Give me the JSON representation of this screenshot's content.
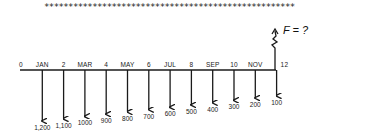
{
  "header": {
    "separator": "****************************************************"
  },
  "cash_flow_diagram": {
    "axis_labels": [
      "0",
      "JAN",
      "2",
      "MAR",
      "4",
      "MAY",
      "6",
      "JUL",
      "8",
      "SEP",
      "10",
      "NOV",
      "12"
    ],
    "payments": [
      {
        "period": 1,
        "label": "1,200"
      },
      {
        "period": 2,
        "label": "1,100"
      },
      {
        "period": 3,
        "label": "1000"
      },
      {
        "period": 4,
        "label": "900"
      },
      {
        "period": 5,
        "label": "800"
      },
      {
        "period": 6,
        "label": "700"
      },
      {
        "period": 7,
        "label": "600"
      },
      {
        "period": 8,
        "label": "500"
      },
      {
        "period": 9,
        "label": "400"
      },
      {
        "period": 10,
        "label": "300"
      },
      {
        "period": 11,
        "label": "200"
      },
      {
        "period": 12,
        "label": "100"
      }
    ],
    "future_value_label": "F = ?"
  }
}
